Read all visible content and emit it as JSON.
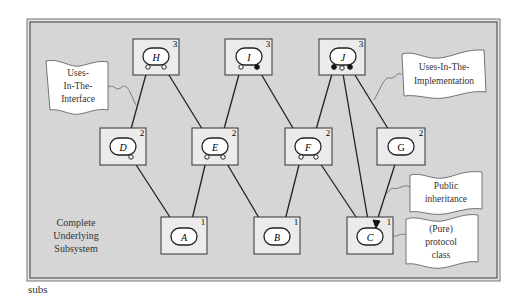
{
  "figure": {
    "caption": "subs",
    "frame_label": [
      "Complete",
      "Underlying",
      "Subsystem"
    ],
    "colors": {
      "frame_bg": "#d6d6d6",
      "box_bg": "#ebebeb",
      "oval_bg": "#ffffff",
      "line": "#222222",
      "callout_bg": "#ffffff",
      "callout_stroke": "#555555"
    }
  },
  "components": [
    {
      "id": "H",
      "level": "3"
    },
    {
      "id": "I",
      "level": "3"
    },
    {
      "id": "J",
      "level": "3"
    },
    {
      "id": "D",
      "level": "2"
    },
    {
      "id": "E",
      "level": "2"
    },
    {
      "id": "F",
      "level": "2"
    },
    {
      "id": "G",
      "level": "2"
    },
    {
      "id": "A",
      "level": "1"
    },
    {
      "id": "B",
      "level": "1"
    },
    {
      "id": "C",
      "level": "1"
    }
  ],
  "dependencies": [
    {
      "from": "H",
      "to": "D",
      "kind": "uses-in-the-interface"
    },
    {
      "from": "H",
      "to": "E",
      "kind": "uses-in-the-interface"
    },
    {
      "from": "I",
      "to": "E",
      "kind": "uses-in-the-interface"
    },
    {
      "from": "I",
      "to": "F",
      "kind": "uses-in-the-implementation"
    },
    {
      "from": "J",
      "to": "F",
      "kind": "uses-in-the-implementation"
    },
    {
      "from": "J",
      "to": "C",
      "kind": "uses-in-the-interface"
    },
    {
      "from": "J",
      "to": "G",
      "kind": "uses-in-the-implementation"
    },
    {
      "from": "D",
      "to": "A",
      "kind": "uses-in-the-interface"
    },
    {
      "from": "E",
      "to": "A",
      "kind": "uses-in-the-interface"
    },
    {
      "from": "E",
      "to": "B",
      "kind": "uses-in-the-interface"
    },
    {
      "from": "F",
      "to": "B",
      "kind": "uses-in-the-interface"
    },
    {
      "from": "F",
      "to": "C",
      "kind": "uses-in-the-interface"
    },
    {
      "from": "G",
      "to": "C",
      "kind": "public-inheritance"
    }
  ],
  "legend": {
    "uses_in_interface": [
      "Uses-",
      "In-The-",
      "Interface"
    ],
    "uses_in_implementation": [
      "Uses-In-The-",
      "Implementation"
    ],
    "public_inheritance": [
      "Public",
      "inheritance"
    ],
    "protocol_class": [
      "(Pure)",
      "protocol",
      "class"
    ]
  }
}
